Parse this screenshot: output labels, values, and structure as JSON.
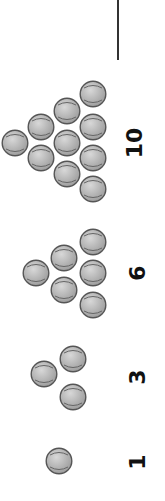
{
  "figure": {
    "ball_color": "#b0b0b0",
    "ball_edge": "#555555",
    "groups": [
      {
        "count": 1,
        "label": "1",
        "label_pos": [
          138,
          462
        ],
        "balls": [
          [
            59,
            461
          ]
        ]
      },
      {
        "count": 3,
        "label": "3",
        "label_pos": [
          138,
          377
        ],
        "balls": [
          [
            73,
            359
          ],
          [
            44,
            374
          ],
          [
            73,
            397
          ]
        ]
      },
      {
        "count": 6,
        "label": "6",
        "label_pos": [
          138,
          273
        ],
        "balls": [
          [
            93,
            242
          ],
          [
            64,
            258
          ],
          [
            93,
            273
          ],
          [
            36,
            273
          ],
          [
            64,
            290
          ],
          [
            93,
            305
          ]
        ]
      },
      {
        "count": 10,
        "label": "10",
        "label_pos": [
          135,
          143
        ],
        "balls": [
          [
            93,
            94
          ],
          [
            67,
            111
          ],
          [
            93,
            127
          ],
          [
            41,
            127
          ],
          [
            67,
            143
          ],
          [
            93,
            158
          ],
          [
            15,
            143
          ],
          [
            41,
            158
          ],
          [
            67,
            174
          ],
          [
            93,
            189
          ]
        ]
      }
    ]
  }
}
